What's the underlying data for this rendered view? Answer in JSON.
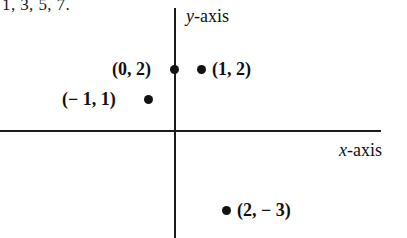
{
  "caption_fragment": "1, 3, 5, 7.",
  "axes": {
    "y_label_var": "y",
    "y_label_suffix": "-axis",
    "x_label_var": "x",
    "x_label_suffix": "-axis"
  },
  "points": [
    {
      "label": "(0, 2)",
      "x": 0,
      "y": 2
    },
    {
      "label": "(1, 2)",
      "x": 1,
      "y": 2
    },
    {
      "label": "(− 1, 1)",
      "x": -1,
      "y": 1
    },
    {
      "label": "(2, − 3)",
      "x": 2,
      "y": -3
    }
  ],
  "chart_data": {
    "type": "scatter",
    "title": "",
    "xlabel": "x-axis",
    "ylabel": "y-axis",
    "grid": false,
    "legend": "none",
    "xlim": [
      -4,
      6
    ],
    "ylim": [
      -5,
      4
    ],
    "series": [
      {
        "name": "plotted points",
        "points": [
          {
            "x": 0,
            "y": 2,
            "label": "(0, 2)"
          },
          {
            "x": 1,
            "y": 2,
            "label": "(1, 2)"
          },
          {
            "x": -1,
            "y": 1,
            "label": "(− 1, 1)"
          },
          {
            "x": 2,
            "y": -3,
            "label": "(2, − 3)"
          }
        ]
      }
    ]
  }
}
